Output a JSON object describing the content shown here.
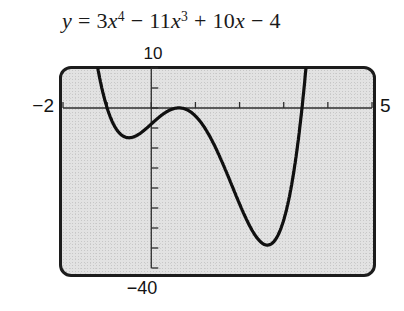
{
  "title": {
    "text": "y = 3x^4 − 11x^3 + 10x − 4",
    "segments": [
      {
        "t": "y",
        "style": "var"
      },
      {
        "t": " = 3",
        "style": "plain"
      },
      {
        "t": "x",
        "style": "var"
      },
      {
        "t": "4",
        "style": "sup"
      },
      {
        "t": " − 11",
        "style": "plain"
      },
      {
        "t": "x",
        "style": "var"
      },
      {
        "t": "3",
        "style": "sup"
      },
      {
        "t": " + 10",
        "style": "plain"
      },
      {
        "t": "x",
        "style": "var"
      },
      {
        "t": " − 4",
        "style": "plain"
      }
    ]
  },
  "chart_data": {
    "type": "line",
    "function_expression": "y = 3x^4 − 11x^3 + 10x − 4",
    "coefficients": [
      3,
      -11,
      0,
      10,
      -4
    ],
    "window": {
      "xmin": -2,
      "xmax": 5,
      "ymin": -40,
      "ymax": 10
    },
    "x_tick_step": 1,
    "y_tick_step": 5,
    "grid": false,
    "labels": {
      "ymax": "10",
      "ymin": "−40",
      "xmin": "−2",
      "xmax": "5"
    },
    "key_points": {
      "x_intercepts": [
        -1,
        0.59,
        0.67,
        3.41
      ],
      "local_minimum_left": {
        "x": -0.51,
        "y": -7.4
      },
      "local_maximum": {
        "x": 0.62,
        "y": 0.02
      },
      "local_minimum_right": {
        "x": 2.63,
        "y": -34.3
      }
    },
    "colors": {
      "curve": "#101010",
      "axis": "#2e2e2e",
      "screen_bg": "#e2e2e2",
      "frame": "#1c1c1c"
    }
  }
}
